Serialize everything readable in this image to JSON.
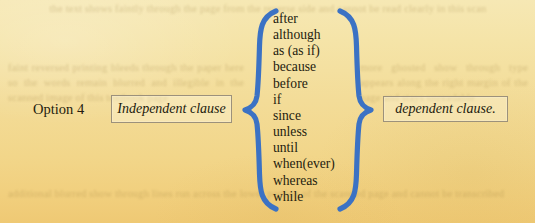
{
  "page": {
    "background_top_color": "#f6e8b4",
    "background_bottom_color": "#efc974",
    "text_color": "#241c0f",
    "brace_color": "#3b72c4",
    "box_border_color": "#9c917b"
  },
  "option": {
    "label": "Option 4"
  },
  "left_box": {
    "text": "Independent clause"
  },
  "right_box": {
    "text": "dependent clause."
  },
  "conjunctions": [
    "after",
    "although",
    "as (as if)",
    "because",
    "before",
    "if",
    "since",
    "unless",
    "until",
    "when(ever)",
    "whereas",
    "while"
  ],
  "show_through_text": {
    "top": "the text shows faintly through the page from the reverse side and cannot be read clearly in this scan",
    "middle_left": "faint reversed printing bleeds through the paper here so the words remain blurred and illegible in the scanned image of this textbook page",
    "middle_right": "more ghosted show through type appears along the right margin of the page and stays unreadable",
    "bottom": "additional blurred show through lines run across the lower portion of the scanned page and cannot be transcribed"
  }
}
